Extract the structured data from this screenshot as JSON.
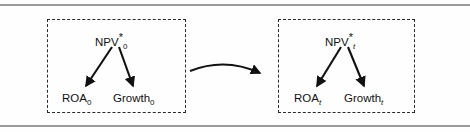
{
  "figure": {
    "type": "diagram",
    "background_color": "#fefefe",
    "line_color": "#111111",
    "rule_color": "#9a9a9a",
    "dashed_border_color": "#2a2a2a"
  },
  "rules": {
    "top_label": "top-horizontal-rule",
    "bottom_label": "bottom-horizontal-rule"
  },
  "panels": [
    {
      "id": "time-0",
      "root": {
        "text": "NPV",
        "superscript": "*",
        "subscript": "0",
        "subscript_italic": false
      },
      "children": [
        {
          "text": "ROA",
          "subscript": "0",
          "subscript_italic": false
        },
        {
          "text": "Growth",
          "subscript": "0",
          "subscript_italic": false
        }
      ]
    },
    {
      "id": "time-t",
      "root": {
        "text": "NPV",
        "superscript": "*",
        "subscript": "t",
        "subscript_italic": true
      },
      "children": [
        {
          "text": "ROA",
          "subscript": "t",
          "subscript_italic": true
        },
        {
          "text": "Growth",
          "subscript": "t",
          "subscript_italic": true
        }
      ]
    }
  ],
  "connector": {
    "name": "curved-transition-arrow",
    "from_panel": "time-0",
    "to_panel": "time-t",
    "direction": "left-to-right"
  }
}
